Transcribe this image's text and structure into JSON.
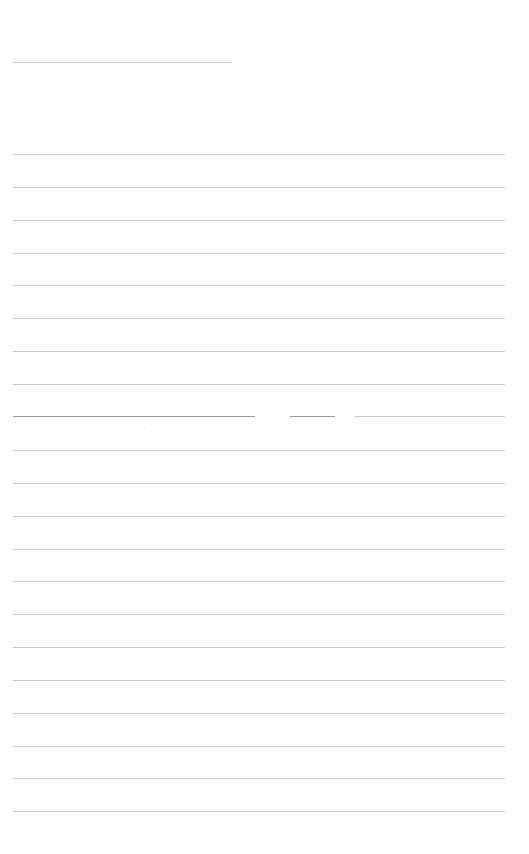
{
  "page": {
    "type": "blank ruled sheet",
    "background": "#ffffff",
    "line_color": "#c9c9c9",
    "header_line": {
      "y": 62,
      "x_start": 13,
      "x_end": 232
    },
    "ruled_lines": {
      "x_start": 13,
      "x_end": 505,
      "y_positions": [
        154,
        187,
        220,
        253,
        285,
        318,
        351,
        384,
        416,
        450,
        483,
        516,
        549,
        581,
        614,
        647,
        680,
        713,
        746,
        778,
        811
      ]
    },
    "broken_line": {
      "y": 416,
      "segments": [
        [
          13,
          255
        ],
        [
          290,
          335
        ],
        [
          355,
          505
        ]
      ]
    },
    "text": []
  }
}
